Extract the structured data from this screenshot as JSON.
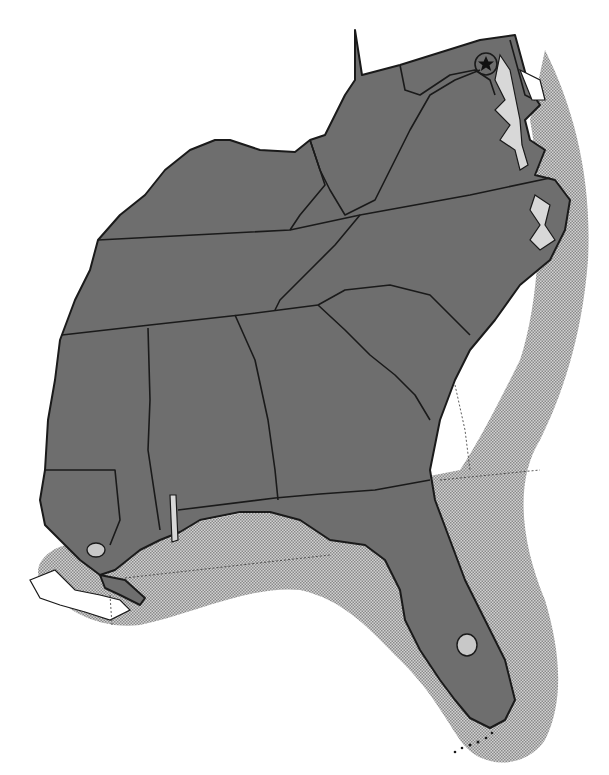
{
  "map": {
    "region": "Southeastern United States",
    "style": "grayscale",
    "colors": {
      "land": "#6e6e6e",
      "border": "#1a1a1a",
      "offshore_water": "#b8b8b8",
      "background": "#ffffff"
    },
    "states": [
      "Kentucky",
      "West Virginia",
      "Virginia",
      "Maryland",
      "Delaware",
      "Tennessee",
      "North Carolina",
      "South Carolina",
      "Georgia",
      "Alabama",
      "Mississippi",
      "Louisiana",
      "Florida"
    ],
    "markers": [
      {
        "type": "capital-star",
        "icon": "star-in-circle",
        "label": "Washington, D.C."
      }
    ],
    "features": [
      "Chesapeake Bay",
      "Lake Okeechobee",
      "Lake Pontchartrain",
      "Mobile Bay",
      "Florida Keys",
      "Pamlico Sound"
    ]
  }
}
